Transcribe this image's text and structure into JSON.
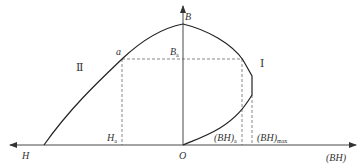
{
  "diagram": {
    "title": "",
    "colors": {
      "curve": "#222222",
      "axis": "#333333",
      "dashed": "#555555",
      "text": "#333333",
      "background": "#ffffff"
    },
    "axes": {
      "vertical": {
        "label": "B"
      },
      "horizontal_left": {
        "label": "H"
      },
      "horizontal_right": {
        "label": "(BH)"
      },
      "origin": {
        "label": "O"
      }
    },
    "curves": [
      {
        "id": "II",
        "label": "Ⅱ",
        "description": "demagnetization curve B vs H"
      },
      {
        "id": "I",
        "label": "Ⅰ",
        "description": "energy product curve B vs (BH)"
      }
    ],
    "points": {
      "a": {
        "label": "a"
      },
      "B_a": {
        "label": "B",
        "subscript": "a"
      },
      "H_a": {
        "label": "H",
        "subscript": "a"
      },
      "BH_a": {
        "label": "(BH)",
        "subscript": "a"
      },
      "BH_max": {
        "label": "(BH)",
        "subscript": "max"
      }
    }
  }
}
